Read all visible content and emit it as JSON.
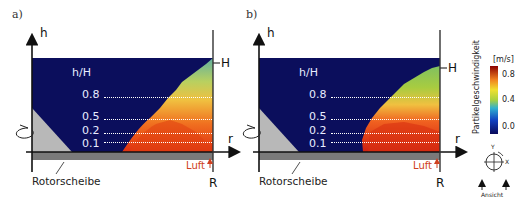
{
  "panels": [
    {
      "label": "a)",
      "axis_h": "h",
      "axis_r": "r",
      "top_marker": "H",
      "ratio_label": "h/H",
      "ticks": [
        "0.8",
        "0.5",
        "0.2",
        "0.1"
      ],
      "rotor_label": "Rotorscheibe",
      "air_label": "Luft",
      "radius_label": "R"
    },
    {
      "label": "b)",
      "axis_h": "h",
      "axis_r": "r",
      "top_marker": "H",
      "ratio_label": "h/H",
      "ticks": [
        "0.8",
        "0.5",
        "0.2",
        "0.1"
      ],
      "rotor_label": "Rotorscheibe",
      "air_label": "Luft",
      "radius_label": "R"
    }
  ],
  "colorbar": {
    "title": "Partikelgeschwindigkeit",
    "unit": "[m/s]",
    "ticks": [
      "0.8",
      "0.4",
      "0.0"
    ],
    "colors": {
      "high": "#8b0000",
      "mid": "#a8d040",
      "low": "#0a0a5a"
    }
  },
  "orientation": {
    "axis_y": "Y",
    "axis_x": "X",
    "view_label": "Ansicht"
  },
  "colors": {
    "background_fluid": "#0b0e5c",
    "rotor": "#7a7a7a",
    "hub": "#b8b8b8",
    "air_arrow": "#d04020"
  }
}
